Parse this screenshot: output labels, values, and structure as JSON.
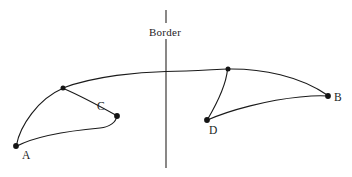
{
  "figure": {
    "background_color": "#ffffff",
    "ink_color": "#1a1a1a",
    "width": 352,
    "height": 177
  },
  "border": {
    "label": "Border",
    "label_x": 148,
    "label_y": 28,
    "line_x": 166,
    "line_top_y": 10,
    "gap_start_y": 23,
    "gap_end_y": 39,
    "line_bottom_y": 168,
    "color": "#33302e"
  },
  "nodes": [
    {
      "id": "A",
      "label": "A",
      "x": 16,
      "y": 146,
      "label_x": 22,
      "label_y": 150,
      "radius": 2.6
    },
    {
      "id": "C",
      "label": "C",
      "x": 117,
      "y": 116,
      "label_x": 97,
      "label_y": 101,
      "radius": 2.6
    },
    {
      "id": "D",
      "label": "D",
      "x": 207,
      "y": 120,
      "label_x": 209,
      "label_y": 125,
      "radius": 2.6
    },
    {
      "id": "B",
      "label": "B",
      "x": 328,
      "y": 96,
      "label_x": 334,
      "label_y": 92,
      "radius": 2.6
    },
    {
      "id": "junction-left",
      "label": "",
      "x": 63,
      "y": 88,
      "label_x": 0,
      "label_y": 0,
      "radius": 2.3
    },
    {
      "id": "junction-right",
      "label": "",
      "x": 228,
      "y": 69,
      "label_x": 0,
      "label_y": 0,
      "radius": 2.3
    }
  ],
  "curves": [
    {
      "id": "upper-trunk",
      "from": "junction-left",
      "to": "junction-right",
      "path": "M 63 88 C 95 76, 140 72, 166 71.5 C 192 71, 214 69.5, 228 69",
      "stroke_width": 1.15
    },
    {
      "id": "upper-trunk-right-to-b",
      "from": "junction-right",
      "to": "B",
      "path": "M 228 69 C 262 68.5, 300 76, 328 95.5",
      "stroke_width": 1.15
    },
    {
      "id": "a-to-junction-left",
      "from": "A",
      "to": "junction-left",
      "path": "M 16.5 145 C 20 126, 38 99, 62.5 88.5",
      "stroke_width": 1.15
    },
    {
      "id": "junction-left-to-c",
      "from": "junction-left",
      "to": "C",
      "path": "M 63.5 88.5 C 81 96, 103 108, 116.5 115.5",
      "stroke_width": 1.15
    },
    {
      "id": "a-to-c-lower",
      "from": "A",
      "to": "C",
      "path": "M 17 146 C 38 135, 78 130, 100 128 C 110 127, 116 122, 117 116",
      "stroke_width": 1.15
    },
    {
      "id": "junction-right-to-d",
      "from": "junction-right",
      "to": "D",
      "path": "M 227.5 69.5 C 226 86, 216 105, 207.5 119.5",
      "stroke_width": 1.15
    },
    {
      "id": "d-to-b-lower",
      "from": "D",
      "to": "B",
      "path": "M 207.5 120 C 230 110, 268 100, 300 97 C 314 95.5, 322 95.5, 327.5 96",
      "stroke_width": 1.15
    }
  ]
}
